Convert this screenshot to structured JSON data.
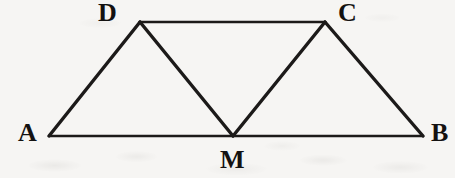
{
  "figure": {
    "background_color": "#f6f5f3",
    "stroke_color": "#1c1a19",
    "width": 455,
    "height": 178,
    "labels": {
      "a": "A",
      "b": "B",
      "c": "C",
      "d": "D",
      "m": "M"
    },
    "points": {
      "A": {
        "x": 49,
        "y": 136
      },
      "B": {
        "x": 423,
        "y": 136
      },
      "C": {
        "x": 325,
        "y": 22
      },
      "D": {
        "x": 140,
        "y": 22
      },
      "M": {
        "x": 233,
        "y": 136
      }
    },
    "segments": [
      {
        "name": "AB",
        "from": "A",
        "to": "B"
      },
      {
        "name": "DC",
        "from": "D",
        "to": "C"
      },
      {
        "name": "AD",
        "from": "A",
        "to": "D"
      },
      {
        "name": "CB",
        "from": "C",
        "to": "B"
      },
      {
        "name": "DM",
        "from": "D",
        "to": "M"
      },
      {
        "name": "CM",
        "from": "C",
        "to": "M"
      }
    ]
  }
}
